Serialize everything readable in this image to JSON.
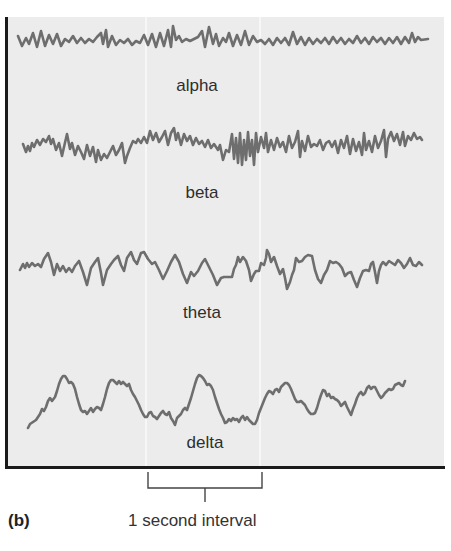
{
  "figure": {
    "panel_label": "(b)",
    "scale_caption": "1 second interval",
    "colors": {
      "background": "#ececec",
      "trace": "#6e6e6e",
      "frame": "#1a1a1a",
      "text": "#2e2e2e"
    }
  },
  "traces": [
    {
      "name": "alpha",
      "label": "alpha"
    },
    {
      "name": "beta",
      "label": "beta"
    },
    {
      "name": "theta",
      "label": "theta"
    },
    {
      "name": "delta",
      "label": "delta"
    }
  ],
  "scale_bar": {
    "x_start": 148,
    "x_end": 262,
    "represents": "1 second"
  }
}
